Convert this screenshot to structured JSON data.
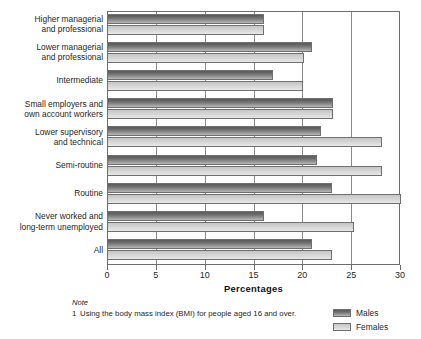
{
  "chart_data": {
    "type": "bar",
    "orientation": "horizontal",
    "title": "",
    "xlabel": "Percentages",
    "ylabel": "",
    "xlim": [
      0,
      30
    ],
    "xticks": [
      0,
      5,
      10,
      15,
      20,
      25,
      30
    ],
    "xtick_labels": [
      "0",
      "5",
      "10",
      "15",
      "20",
      "25",
      "30"
    ],
    "grid": true,
    "legend_position": "bottom-right",
    "categories": [
      "Higher managerial and professional",
      "Lower managerial and professional",
      "Intermediate",
      "Small employers and own account workers",
      "Lower supervisory and technical",
      "Semi-routine",
      "Routine",
      "Never worked and long-term unemployed",
      "All"
    ],
    "category_lines": [
      [
        "Higher managerial",
        "and professional"
      ],
      [
        "Lower managerial",
        "and professional"
      ],
      [
        "Intermediate"
      ],
      [
        "Small employers and",
        "own account workers"
      ],
      [
        "Lower supervisory",
        "and technical"
      ],
      [
        "Semi-routine"
      ],
      [
        "Routine"
      ],
      [
        "Never worked and",
        "long-term unemployed"
      ],
      [
        "All"
      ]
    ],
    "series": [
      {
        "name": "Males",
        "color": "#6e6e6e",
        "values": [
          16.1,
          21.0,
          17.0,
          23.1,
          21.9,
          21.5,
          23.0,
          16.1,
          21.0
        ]
      },
      {
        "name": "Females",
        "color": "#d8d8d8",
        "values": [
          16.1,
          20.2,
          20.1,
          23.1,
          28.2,
          28.2,
          30.1,
          25.3,
          23.0
        ]
      }
    ]
  },
  "note": {
    "heading": "Note",
    "items": [
      {
        "number": "1",
        "text": "Using the body mass index (BMI) for people aged 16 and over."
      }
    ]
  },
  "legend": {
    "items": [
      {
        "label": "Males"
      },
      {
        "label": "Females"
      }
    ]
  }
}
